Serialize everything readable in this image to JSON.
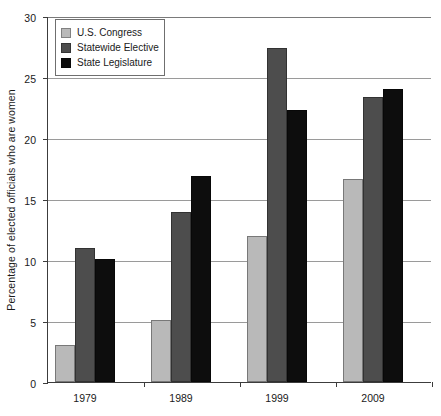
{
  "chart_data": {
    "type": "bar",
    "title": "",
    "subtitle": "",
    "xlabel": "",
    "ylabel": "Percentage of elected officials who are women",
    "categories": [
      "1979",
      "1989",
      "1999",
      "2009"
    ],
    "series": [
      {
        "name": "U.S. Congress",
        "color": "#b9b9b9",
        "values": [
          3.0,
          5.1,
          12.0,
          16.6
        ]
      },
      {
        "name": "Statewide Elective",
        "color": "#4d4d4d",
        "values": [
          11.0,
          13.9,
          27.4,
          23.4
        ]
      },
      {
        "name": "State Legislature",
        "color": "#0d0d0d",
        "values": [
          10.1,
          16.9,
          22.3,
          24.0
        ]
      }
    ],
    "ylim": [
      0,
      30
    ],
    "ytick_labels": [
      "0",
      "5",
      "10",
      "15",
      "20",
      "25",
      "30"
    ],
    "ytick_values": [
      0,
      5,
      10,
      15,
      20,
      25,
      30
    ],
    "grid": true,
    "grid_axis": "y",
    "legend_position": "top-left",
    "bar_group_spacing": "grouped"
  },
  "legend": {
    "items": [
      {
        "label": "U.S. Congress",
        "color": "#b9b9b9"
      },
      {
        "label": "Statewide Elective",
        "color": "#4d4d4d"
      },
      {
        "label": "State Legislature",
        "color": "#0d0d0d"
      }
    ]
  }
}
